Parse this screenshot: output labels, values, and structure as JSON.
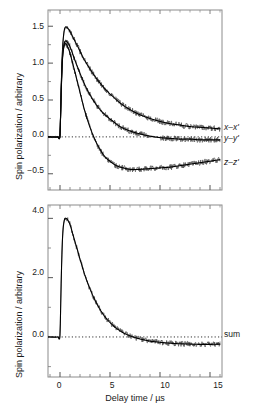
{
  "figure": {
    "ylabel": "Spin polarization / arbitrary",
    "xlabel": "Delay time / µs"
  },
  "top_panel": {
    "ylabel": "Spin polarization / arbitrary",
    "yticks": [
      "1.5",
      "1.0",
      "0.5",
      "0.0",
      "−0.5"
    ],
    "labels": {
      "xx": "x–x'",
      "yy": "y–y'",
      "zz": "z–z'"
    }
  },
  "bottom_panel": {
    "ylabel": "Spin polarization / arbitrary",
    "xlabel": "Delay time / µs",
    "yticks": [
      "4.0",
      "2.0",
      "0.0"
    ],
    "xticks": [
      "0",
      "5",
      "10",
      "15"
    ],
    "labels": {
      "sum": "sum"
    }
  },
  "chart_data": [
    {
      "type": "line",
      "title": "",
      "xlabel": "",
      "ylabel": "Spin polarization / arbitrary",
      "xlim": [
        -1.2,
        16.2
      ],
      "ylim": [
        -0.72,
        1.72
      ],
      "xticks": [
        0,
        5,
        10,
        15
      ],
      "yticks": [
        -0.5,
        0.0,
        0.5,
        1.0,
        1.5
      ],
      "ytick_labels": [
        "−0.5",
        "0.0",
        "0.5",
        "1.0",
        "1.5"
      ],
      "grid": false,
      "legend": "right-inline",
      "zero_line": true,
      "series": [
        {
          "name": "x–x'",
          "label_text": "x–x'",
          "x": [
            -1.2,
            -0.2,
            0.0,
            0.1,
            0.2,
            0.3,
            0.45,
            0.6,
            0.8,
            1.0,
            1.3,
            1.6,
            2.0,
            2.5,
            3.0,
            3.5,
            4.0,
            4.5,
            5.0,
            6.0,
            7.0,
            8.0,
            9.0,
            10.0,
            11.0,
            12.0,
            13.0,
            14.0,
            15.0,
            16.0
          ],
          "values": [
            0.0,
            0.0,
            0.02,
            0.55,
            1.02,
            1.3,
            1.46,
            1.49,
            1.47,
            1.43,
            1.35,
            1.27,
            1.16,
            1.03,
            0.92,
            0.82,
            0.73,
            0.65,
            0.58,
            0.46,
            0.37,
            0.3,
            0.25,
            0.21,
            0.18,
            0.16,
            0.14,
            0.13,
            0.12,
            0.11
          ]
        },
        {
          "name": "y–y'",
          "label_text": "y–y'",
          "x": [
            -1.2,
            -0.2,
            0.0,
            0.1,
            0.2,
            0.3,
            0.45,
            0.6,
            0.8,
            1.0,
            1.3,
            1.6,
            2.0,
            2.5,
            3.0,
            3.5,
            4.0,
            4.5,
            5.0,
            6.0,
            7.0,
            8.0,
            9.0,
            10.0,
            11.0,
            12.0,
            13.0,
            14.0,
            15.0,
            16.0
          ],
          "values": [
            0.0,
            0.0,
            0.02,
            0.52,
            0.95,
            1.17,
            1.28,
            1.3,
            1.27,
            1.22,
            1.11,
            1.0,
            0.86,
            0.7,
            0.57,
            0.46,
            0.37,
            0.3,
            0.24,
            0.14,
            0.08,
            0.04,
            0.01,
            -0.01,
            -0.02,
            -0.03,
            -0.03,
            -0.04,
            -0.04,
            -0.04
          ]
        },
        {
          "name": "z–z'",
          "label_text": "z–z'",
          "x": [
            -1.2,
            -0.2,
            0.0,
            0.1,
            0.2,
            0.3,
            0.45,
            0.6,
            0.8,
            1.0,
            1.3,
            1.6,
            2.0,
            2.5,
            3.0,
            3.5,
            4.0,
            4.5,
            5.0,
            5.5,
            6.0,
            7.0,
            8.0,
            9.0,
            10.0,
            11.0,
            12.0,
            13.0,
            14.0,
            15.0,
            16.0
          ],
          "values": [
            0.0,
            0.0,
            0.02,
            0.5,
            0.92,
            1.14,
            1.25,
            1.26,
            1.21,
            1.13,
            0.98,
            0.82,
            0.6,
            0.34,
            0.13,
            -0.04,
            -0.17,
            -0.27,
            -0.33,
            -0.38,
            -0.41,
            -0.44,
            -0.44,
            -0.43,
            -0.42,
            -0.41,
            -0.39,
            -0.37,
            -0.35,
            -0.33,
            -0.31
          ]
        }
      ]
    },
    {
      "type": "line",
      "title": "",
      "xlabel": "Delay time / µs",
      "ylabel": "Spin polarization / arbitrary",
      "xlim": [
        -1.2,
        16.2
      ],
      "ylim": [
        -1.35,
        4.45
      ],
      "xticks": [
        0,
        5,
        10,
        15
      ],
      "yticks": [
        0.0,
        2.0,
        4.0
      ],
      "ytick_labels": [
        "0.0",
        "2.0",
        "4.0"
      ],
      "grid": false,
      "legend": "right-inline",
      "zero_line": true,
      "series": [
        {
          "name": "sum",
          "label_text": "sum",
          "x": [
            -1.2,
            -0.2,
            0.0,
            0.1,
            0.2,
            0.3,
            0.45,
            0.6,
            0.8,
            1.0,
            1.3,
            1.6,
            2.0,
            2.5,
            3.0,
            3.5,
            4.0,
            4.5,
            5.0,
            5.5,
            6.0,
            6.5,
            7.0,
            7.5,
            8.0,
            9.0,
            10.0,
            11.0,
            12.0,
            13.0,
            14.0,
            15.0,
            16.0
          ],
          "values": [
            0.0,
            0.0,
            0.06,
            1.57,
            2.89,
            3.61,
            3.96,
            4.0,
            3.93,
            3.78,
            3.44,
            3.09,
            2.62,
            2.07,
            1.62,
            1.24,
            0.93,
            0.68,
            0.49,
            0.33,
            0.21,
            0.11,
            0.04,
            -0.02,
            -0.07,
            -0.14,
            -0.18,
            -0.21,
            -0.23,
            -0.24,
            -0.25,
            -0.25,
            -0.24
          ]
        }
      ]
    }
  ]
}
